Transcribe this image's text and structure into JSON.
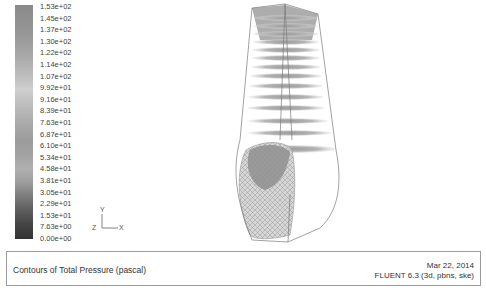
{
  "colorbar": {
    "labels": [
      "1.53e+02",
      "1.45e+02",
      "1.37e+02",
      "1.30e+02",
      "1.22e+02",
      "1.14e+02",
      "1.07e+02",
      "9.92e+01",
      "9.16e+01",
      "8.39e+01",
      "7.63e+01",
      "6.87e+01",
      "6.10e+01",
      "5.34e+01",
      "4.58e+01",
      "3.81e+01",
      "3.05e+01",
      "2.29e+01",
      "1.53e+01",
      "7.63e+00",
      "0.00e+00"
    ]
  },
  "axes": {
    "x": "X",
    "y": "Y",
    "z": "Z"
  },
  "caption": {
    "title": "Contours of Total Pressure (pascal)",
    "date": "Mar 22, 2014",
    "solver": "FLUENT 6.3 (3d, pbns, ske)"
  },
  "colors": {
    "background": "#ffffff",
    "outline": "#7a7a7a",
    "caption_border": "#9a9a9a"
  }
}
